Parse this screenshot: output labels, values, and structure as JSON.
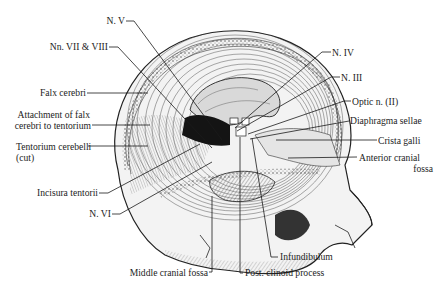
{
  "figure": {
    "labels_left": [
      {
        "id": "n-v",
        "text": "N. V"
      },
      {
        "id": "nn-vii-viii",
        "text": "Nn. VII & VIII"
      },
      {
        "id": "falx-cerebri",
        "text": "Falx cerebri"
      },
      {
        "id": "attachment-1",
        "text": "Attachment of falx"
      },
      {
        "id": "attachment-2",
        "text": "cerebri to tentorium"
      },
      {
        "id": "tentorium-1",
        "text": "Tentorium cerebelli"
      },
      {
        "id": "tentorium-2",
        "text": "(cut)"
      },
      {
        "id": "incisura",
        "text": "Incisura tentorii"
      },
      {
        "id": "n-vi",
        "text": "N. VI"
      }
    ],
    "labels_right": [
      {
        "id": "n-iv",
        "text": "N. IV"
      },
      {
        "id": "n-iii",
        "text": "N. III"
      },
      {
        "id": "optic-n",
        "text": "Optic n. (II)"
      },
      {
        "id": "diaphragma",
        "text": "Diaphragma sellae"
      },
      {
        "id": "crista",
        "text": "Crista galli"
      },
      {
        "id": "anterior-1",
        "text": "Anterior cranial"
      },
      {
        "id": "anterior-2",
        "text": "fossa"
      }
    ],
    "labels_bottom": [
      {
        "id": "infundibulum",
        "text": "Infundibulum"
      },
      {
        "id": "middle-fossa",
        "text": "Middle cranial fossa"
      },
      {
        "id": "post-clinoid",
        "text": "Post. clinoid process"
      }
    ]
  }
}
